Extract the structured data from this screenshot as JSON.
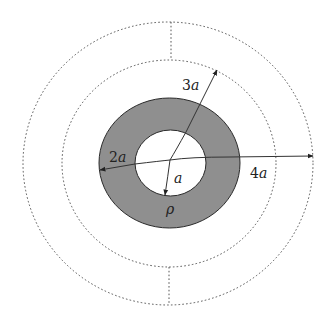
{
  "diagram": {
    "colors": {
      "shell_fill": "#8f8f8f",
      "background": "#ffffff",
      "line": "#333333"
    },
    "regions": {
      "inner_cavity": {
        "radius_label": "a"
      },
      "charged_shell": {
        "inner_radius": "a",
        "outer_radius": "2a",
        "density_label": "ρ"
      },
      "dashed_surface_inner": {
        "radius": "3a"
      },
      "dashed_surface_outer": {
        "radius": "4a"
      }
    },
    "labels": {
      "r_a": {
        "coef": "",
        "sym": "a"
      },
      "r_2a": {
        "coef": "2",
        "sym": "a"
      },
      "r_3a": {
        "coef": "3",
        "sym": "a"
      },
      "r_4a": {
        "coef": "4",
        "sym": "a"
      },
      "density": "ρ"
    }
  }
}
